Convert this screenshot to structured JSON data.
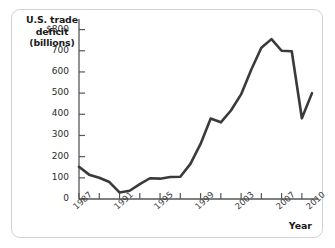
{
  "figure": {
    "y_axis_title": [
      "U.S. trade",
      "deficit",
      "(billions)"
    ],
    "x_axis_title": "Year",
    "line_color": "#3a3a3a",
    "frame_color": "#d2d2d2",
    "background": "#ffffff"
  },
  "chart_data": {
    "type": "line",
    "title": "",
    "xlabel": "Year",
    "ylabel": "U.S. trade deficit (billions)",
    "xlim": [
      1987,
      2010
    ],
    "ylim": [
      0,
      850
    ],
    "grid": false,
    "legend": "none",
    "ytick_labels": [
      "$800",
      "700",
      "600",
      "500",
      "400",
      "300",
      "200",
      "100",
      "0"
    ],
    "ytick_values": [
      800,
      700,
      600,
      500,
      400,
      300,
      200,
      100,
      0
    ],
    "xtick_labels": [
      "1987",
      "1991",
      "1995",
      "1999",
      "2003",
      "2007",
      "2010"
    ],
    "xtick_values": [
      1987,
      1991,
      1995,
      1999,
      2003,
      2007,
      2010
    ],
    "x": [
      1987,
      1988,
      1989,
      1990,
      1991,
      1992,
      1993,
      1994,
      1995,
      1996,
      1997,
      1998,
      1999,
      2000,
      2001,
      2002,
      2003,
      2004,
      2005,
      2006,
      2007,
      2008,
      2009,
      2010
    ],
    "values": [
      152,
      115,
      100,
      80,
      31,
      39,
      70,
      98,
      96,
      104,
      105,
      166,
      260,
      380,
      362,
      418,
      494,
      610,
      714,
      755,
      700,
      698,
      381,
      500
    ],
    "series": [
      {
        "name": "U.S. trade deficit",
        "values": [
          152,
          115,
          100,
          80,
          31,
          39,
          70,
          98,
          96,
          104,
          105,
          166,
          260,
          380,
          362,
          418,
          494,
          610,
          714,
          755,
          700,
          698,
          381,
          500
        ]
      }
    ],
    "annotations": []
  }
}
